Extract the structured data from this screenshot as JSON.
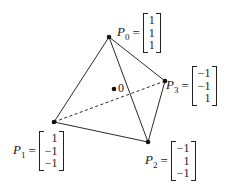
{
  "figure": {
    "origin_label": "0",
    "points": [
      {
        "name": "P",
        "sub": "0",
        "vector": [
          "1",
          "1",
          "1"
        ]
      },
      {
        "name": "P",
        "sub": "1",
        "vector": [
          "1",
          "−1",
          "−1"
        ]
      },
      {
        "name": "P",
        "sub": "2",
        "vector": [
          "−1",
          "1",
          "−1"
        ]
      },
      {
        "name": "P",
        "sub": "3",
        "vector": [
          "−1",
          "−1",
          "1"
        ]
      }
    ],
    "equals": "="
  }
}
